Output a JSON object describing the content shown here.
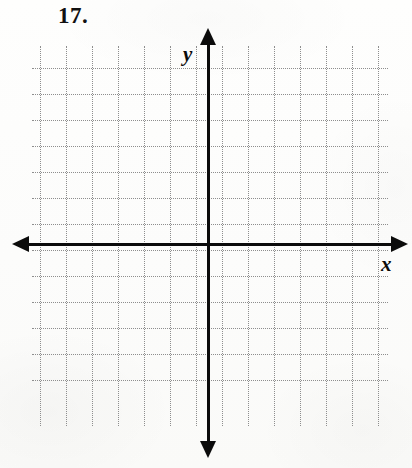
{
  "page": {
    "width": 412,
    "height": 468,
    "background_color": "#fdfdfc",
    "ink_color": "#0b0b0b",
    "gridline_color": "#8e8e8e"
  },
  "problem": {
    "number_label": "17."
  },
  "chart_data": {
    "type": "scatter",
    "title": "",
    "subtitle": "",
    "xlabel": "x",
    "ylabel": "y",
    "series": [
      {
        "name": "plotted points",
        "x": [],
        "y": []
      }
    ],
    "categories": [],
    "values": [],
    "annotations": [],
    "legend": {
      "entries": [],
      "position": "none"
    },
    "grid": {
      "visible": true,
      "style": "dotted",
      "color": "#8e8e8e",
      "cell_size_px": 26,
      "vertical_lines": 14,
      "horizontal_lines": 13
    },
    "axes": {
      "x": {
        "label": "x",
        "tick_labels": [],
        "ticks_visible": false,
        "arrows": [
          "left",
          "right"
        ],
        "range_cells": [
          -7,
          6
        ]
      },
      "y": {
        "label": "y",
        "tick_labels": [],
        "ticks_visible": false,
        "arrows": [
          "up",
          "down"
        ],
        "range_cells": [
          -6,
          7
        ]
      }
    },
    "origin_label": ""
  },
  "geometry": {
    "grid": {
      "left": 40,
      "right": 376,
      "top": 68,
      "bottom": 406,
      "step": 26,
      "v_extent_top": 46,
      "v_extent_bottom": 426,
      "h_extent_left": 32,
      "h_extent_right": 388
    },
    "axis_x": {
      "y": 244,
      "x_start": 28,
      "x_end": 392
    },
    "axis_y": {
      "x": 208,
      "y_start": 44,
      "y_end": 442
    }
  },
  "labels": {
    "y_axis": "y",
    "x_axis": "x"
  }
}
